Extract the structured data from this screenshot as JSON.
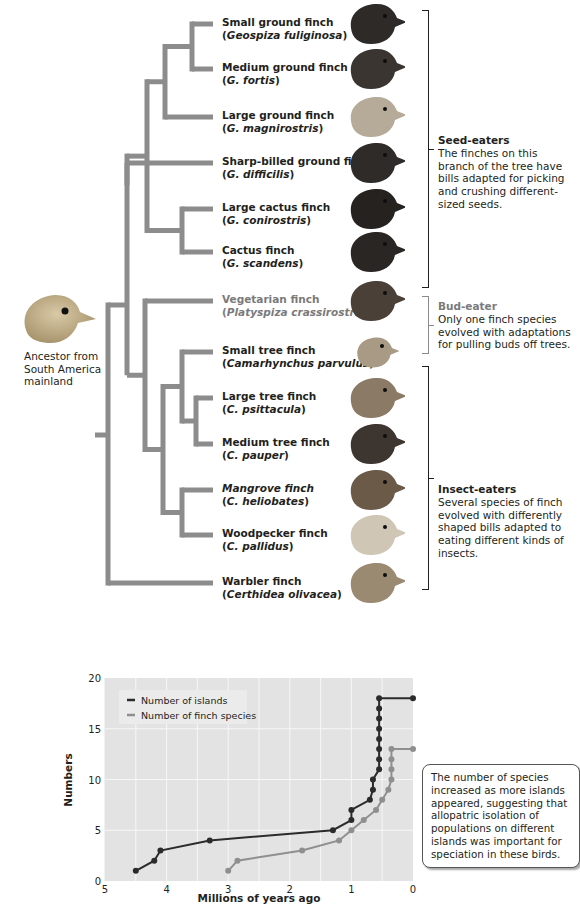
{
  "top_caption": "",
  "ancestor": {
    "line1": "Ancestor from",
    "line2": "South America",
    "line3": "mainland"
  },
  "species": [
    {
      "common": "Small ground finch",
      "sci": "Geospiza fuliginosa",
      "group": "seed"
    },
    {
      "common": "Medium ground finch",
      "sci": "G. fortis",
      "group": "seed"
    },
    {
      "common": "Large ground finch",
      "sci": "G. magnirostris",
      "group": "seed"
    },
    {
      "common": "Sharp-billed ground finch",
      "sci": "G. difficilis",
      "group": "seed"
    },
    {
      "common": "Large cactus finch",
      "sci": "G. conirostris",
      "group": "seed"
    },
    {
      "common": "Cactus finch",
      "sci": "G. scandens",
      "group": "seed"
    },
    {
      "common": "Vegetarian finch",
      "sci": "Platyspiza crassirostris",
      "group": "bud"
    },
    {
      "common": "Small tree finch",
      "sci": "Camarhynchus parvulus",
      "group": "insect"
    },
    {
      "common": "Large tree finch",
      "sci": "C. psittacula",
      "group": "insect"
    },
    {
      "common": "Medium tree finch",
      "sci": "C. pauper",
      "group": "insect"
    },
    {
      "common": "Mangrove finch",
      "sci": "C. heliobates",
      "group": "insect"
    },
    {
      "common": "Woodpecker finch",
      "sci": "C. pallidus",
      "group": "insect"
    },
    {
      "common": "Warbler finch",
      "sci": "Certhidea olivacea",
      "group": "insect"
    }
  ],
  "groups": {
    "seed": {
      "title": "Seed-eaters",
      "desc": "The finches on this branch of the tree have bills adapted for picking and crushing different-sized seeds."
    },
    "bud": {
      "title": "Bud-eater",
      "desc": "Only one finch species evolved with adaptations for pulling buds off trees."
    },
    "insect": {
      "title": "Insect-eaters",
      "desc": "Several species of finch evolved with differently shaped bills adapted to eating different kinds of insects."
    }
  },
  "colors": {
    "branch": "#8c8c8c",
    "islands_line": "#2b2b2b",
    "species_line": "#8f8f8f",
    "plot_bg": "#e3e3e3",
    "grid": "#f5f5f5"
  },
  "note": "The number of species increased as more islands appeared, suggesting that allopatric isolation of populations on different islands was important for speciation in these birds.",
  "chart_data": {
    "type": "line",
    "title": "",
    "xlabel": "Millions of years ago",
    "ylabel": "Numbers",
    "xlim": [
      5,
      0
    ],
    "ylim": [
      0,
      20
    ],
    "x_ticks": [
      "5",
      "4",
      "3",
      "2",
      "1",
      "0"
    ],
    "y_ticks": [
      "0",
      "5",
      "10",
      "15",
      "20"
    ],
    "grid": true,
    "legend_position": "upper-left",
    "series": [
      {
        "name": "Number of islands",
        "color": "#2b2b2b",
        "points": [
          [
            4.5,
            1
          ],
          [
            4.2,
            2
          ],
          [
            4.1,
            3
          ],
          [
            3.3,
            4
          ],
          [
            1.3,
            5
          ],
          [
            1.0,
            6
          ],
          [
            1.0,
            7
          ],
          [
            0.7,
            8
          ],
          [
            0.65,
            9
          ],
          [
            0.65,
            10
          ],
          [
            0.55,
            11
          ],
          [
            0.55,
            12
          ],
          [
            0.55,
            13
          ],
          [
            0.55,
            14
          ],
          [
            0.55,
            15
          ],
          [
            0.55,
            16
          ],
          [
            0.55,
            17
          ],
          [
            0.55,
            18
          ],
          [
            0,
            18
          ]
        ]
      },
      {
        "name": "Number of finch species",
        "color": "#8f8f8f",
        "points": [
          [
            3.0,
            1
          ],
          [
            2.85,
            2
          ],
          [
            1.8,
            3
          ],
          [
            1.2,
            4
          ],
          [
            1.0,
            5
          ],
          [
            0.8,
            6
          ],
          [
            0.6,
            7
          ],
          [
            0.5,
            8
          ],
          [
            0.4,
            9
          ],
          [
            0.35,
            10
          ],
          [
            0.35,
            11
          ],
          [
            0.35,
            12
          ],
          [
            0.35,
            13
          ],
          [
            0,
            13
          ]
        ]
      }
    ]
  }
}
